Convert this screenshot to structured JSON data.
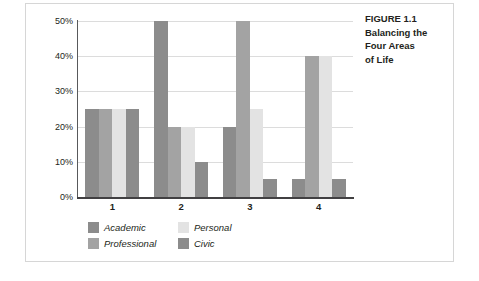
{
  "caption": {
    "lines": [
      "FIGURE 1.1",
      "Balancing the",
      "Four Areas",
      "of Life"
    ]
  },
  "chart_data": {
    "type": "bar",
    "title": "",
    "subtitle": "",
    "xlabel": "",
    "ylabel": "",
    "categories": [
      "1",
      "2",
      "3",
      "4"
    ],
    "ytick_labels": [
      "0%",
      "10%",
      "20%",
      "30%",
      "40%",
      "50%"
    ],
    "ytick_values": [
      0,
      10,
      20,
      30,
      40,
      50
    ],
    "ylim": [
      0,
      50
    ],
    "grid": "horizontal",
    "legend_position": "bottom-left",
    "series": [
      {
        "name": "Academic",
        "color": "#8c8c8c",
        "values": [
          25,
          50,
          20,
          5
        ]
      },
      {
        "name": "Professional",
        "color": "#a3a3a3",
        "values": [
          25,
          20,
          50,
          40
        ]
      },
      {
        "name": "Personal",
        "color": "#e3e3e3",
        "values": [
          25,
          20,
          25,
          40
        ]
      },
      {
        "name": "Civic",
        "color": "#8c8c8c",
        "values": [
          25,
          10,
          5,
          5
        ]
      }
    ]
  },
  "legend": {
    "order": [
      {
        "label": "Academic",
        "color": "#8c8c8c"
      },
      {
        "label": "Professional",
        "color": "#a3a3a3"
      },
      {
        "label": "Personal",
        "color": "#e3e3e3"
      },
      {
        "label": "Civic",
        "color": "#8c8c8c"
      }
    ]
  },
  "colors": {
    "gridline": "#dcdcdc",
    "axis": "#414042",
    "frame_border": "#d6d6d6",
    "text": "#231f20",
    "background": "#ffffff"
  }
}
